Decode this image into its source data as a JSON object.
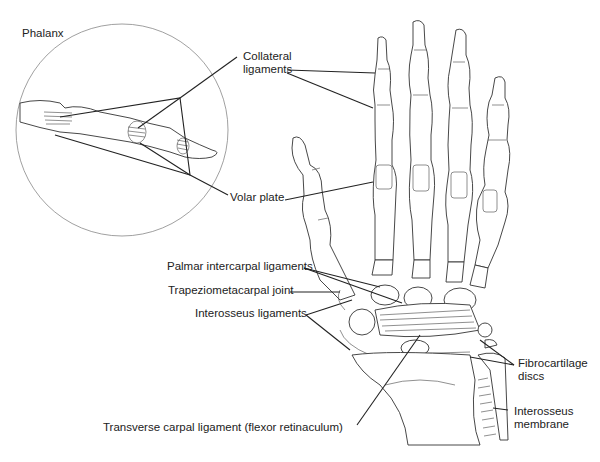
{
  "diagram": {
    "labels": {
      "phalanx": "Phalanx",
      "collateral_line1": "Collateral",
      "collateral_line2": "ligaments",
      "volar_plate": "Volar plate",
      "palmar_intercarpal": "Palmar intercarpal ligaments",
      "trapeziometacarpal": "Trapeziometacarpal joint",
      "interosseus_ligaments": "Interosseus ligaments",
      "transverse_carpal": "Transverse carpal ligament (flexor retinaculum)",
      "fibrocartilage_line1": "Fibrocartilage",
      "fibrocartilage_line2": "discs",
      "interosseus_membrane_line1": "Interosseus",
      "interosseus_membrane_line2": "membrane"
    },
    "colors": {
      "line": "#222222",
      "inset_circle": "#888888",
      "background": "#ffffff"
    }
  }
}
